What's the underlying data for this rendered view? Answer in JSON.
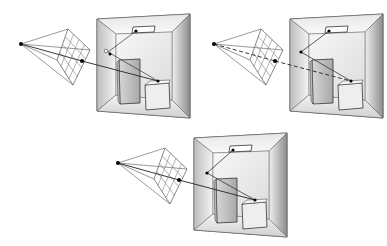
{
  "figure": {
    "colors": {
      "background": "#ffffff",
      "line": "#222222",
      "grid": "#555555",
      "wall_light": "#f2f2f2",
      "wall_dark": "#9a9a9a",
      "block_front": "#e9e9e9",
      "point": "#000000"
    },
    "panels": [
      {
        "id": "top-left",
        "ray_style": "solid",
        "offset": [
          0,
          0
        ]
      },
      {
        "id": "top-right",
        "ray_style": "dashed",
        "offset": [
          193,
          0
        ]
      },
      {
        "id": "bottom-center",
        "ray_style": "solid",
        "offset": [
          97,
          122
        ]
      }
    ],
    "elements": [
      "eye-point",
      "image-plane-grid",
      "room-box",
      "ceiling-light",
      "tall-block",
      "short-block",
      "rays"
    ]
  }
}
